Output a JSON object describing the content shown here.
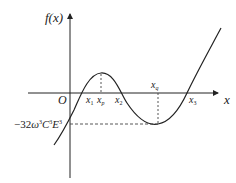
{
  "diagram": {
    "type": "function-graph",
    "y_axis_label": "f(x)",
    "x_axis_label": "x",
    "origin_label": "O",
    "points": {
      "x1": {
        "base": "x",
        "sub": "1"
      },
      "xp": {
        "base": "x",
        "sub": "p"
      },
      "x2": {
        "base": "x",
        "sub": "2"
      },
      "xq": {
        "base": "x",
        "sub": "q"
      },
      "x3": {
        "base": "x",
        "sub": "3"
      }
    },
    "min_value_label": {
      "prefix": "−32",
      "omega": "ω",
      "c": "C",
      "e": "E",
      "exp": "3"
    },
    "colors": {
      "curve": "#222222",
      "axes": "#222222",
      "guides": "#444444"
    }
  }
}
